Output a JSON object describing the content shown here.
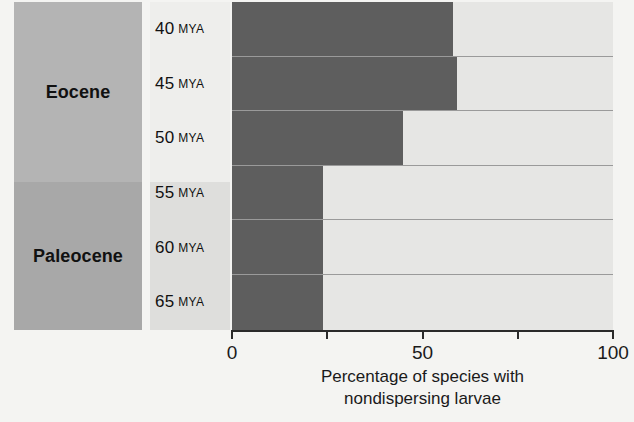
{
  "chart_data": {
    "type": "bar",
    "orientation": "horizontal",
    "title": "",
    "xlabel": "Percentage of species with nondispersing larvae",
    "ylabel": "",
    "xlim": [
      0,
      100
    ],
    "grid": false,
    "legend": null,
    "categories": [
      "40 MYA",
      "45 MYA",
      "50 MYA",
      "55 MYA",
      "60 MYA",
      "65 MYA"
    ],
    "values": [
      58,
      59,
      45,
      24,
      24,
      24
    ],
    "x_ticks": [
      0,
      25,
      50,
      75,
      100
    ],
    "x_tick_labels": [
      "0",
      "",
      "50",
      "",
      "100"
    ],
    "bar_color": "#5e5e5e",
    "track_color": "#e6e6e4",
    "groups": [
      {
        "name": "Eocene",
        "categories": [
          "40 MYA",
          "45 MYA",
          "50 MYA"
        ],
        "color": "#b4b4b4"
      },
      {
        "name": "Paleocene",
        "categories": [
          "55 MYA",
          "60 MYA",
          "65 MYA"
        ],
        "color": "#a8a8a8"
      }
    ]
  },
  "epochs": {
    "eocene": "Eocene",
    "paleocene": "Paleocene"
  },
  "rows": [
    {
      "num": "40",
      "unit": "MYA",
      "value": 58
    },
    {
      "num": "45",
      "unit": "MYA",
      "value": 59
    },
    {
      "num": "50",
      "unit": "MYA",
      "value": 45
    },
    {
      "num": "55",
      "unit": "MYA",
      "value": 24
    },
    {
      "num": "60",
      "unit": "MYA",
      "value": 24
    },
    {
      "num": "65",
      "unit": "MYA",
      "value": 24
    }
  ],
  "axis": {
    "ticks": [
      {
        "value": 0,
        "label": "0"
      },
      {
        "value": 25,
        "label": ""
      },
      {
        "value": 50,
        "label": "50"
      },
      {
        "value": 75,
        "label": ""
      },
      {
        "value": 100,
        "label": "100"
      }
    ],
    "title_line1": "Percentage of species with",
    "title_line2": "nondispersing larvae"
  }
}
